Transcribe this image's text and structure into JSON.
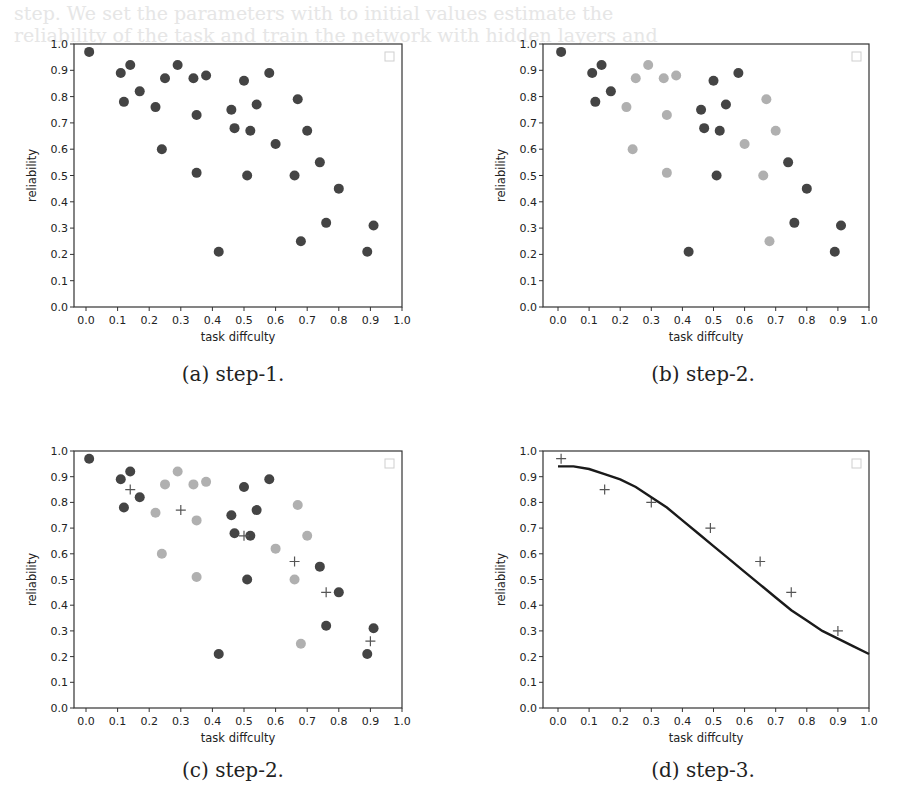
{
  "background_text": [
    "step. We set the parameters with to initial values estimate the",
    "reliability of the task and train the network with hidden layers and",
    "the output is the reliability function mapped by the logistic model"
  ],
  "chart_data": [
    {
      "id": "a",
      "type": "scatter",
      "caption": "(a) step-1.",
      "xlabel": "task diffculty",
      "ylabel": "reliability",
      "xlim": [
        0.0,
        1.0
      ],
      "ylim": [
        0.0,
        1.0
      ],
      "xticks": [
        "0.0",
        "0.1",
        "0.2",
        "0.3",
        "0.4",
        "0.5",
        "0.6",
        "0.7",
        "0.8",
        "0.9",
        "1.0"
      ],
      "yticks": [
        "0.0",
        "0.1",
        "0.2",
        "0.3",
        "0.4",
        "0.5",
        "0.6",
        "0.7",
        "0.8",
        "0.9",
        "1.0"
      ],
      "grid": false,
      "legend": "empty box, upper right",
      "series": [
        {
          "name": "tasks",
          "marker": "circle",
          "color": "#444444",
          "points": [
            [
              0.01,
              0.97
            ],
            [
              0.11,
              0.89
            ],
            [
              0.14,
              0.92
            ],
            [
              0.12,
              0.78
            ],
            [
              0.17,
              0.82
            ],
            [
              0.22,
              0.76
            ],
            [
              0.25,
              0.87
            ],
            [
              0.29,
              0.92
            ],
            [
              0.24,
              0.6
            ],
            [
              0.34,
              0.87
            ],
            [
              0.38,
              0.88
            ],
            [
              0.35,
              0.73
            ],
            [
              0.35,
              0.51
            ],
            [
              0.42,
              0.21
            ],
            [
              0.5,
              0.86
            ],
            [
              0.58,
              0.89
            ],
            [
              0.46,
              0.75
            ],
            [
              0.54,
              0.77
            ],
            [
              0.47,
              0.68
            ],
            [
              0.52,
              0.67
            ],
            [
              0.51,
              0.5
            ],
            [
              0.6,
              0.62
            ],
            [
              0.67,
              0.79
            ],
            [
              0.7,
              0.67
            ],
            [
              0.66,
              0.5
            ],
            [
              0.74,
              0.55
            ],
            [
              0.8,
              0.45
            ],
            [
              0.76,
              0.32
            ],
            [
              0.68,
              0.25
            ],
            [
              0.89,
              0.21
            ],
            [
              0.91,
              0.31
            ]
          ]
        }
      ]
    },
    {
      "id": "b",
      "type": "scatter",
      "caption": "(b) step-2.",
      "xlabel": "task diffculty",
      "ylabel": "reliability",
      "xlim": [
        0.0,
        1.0
      ],
      "ylim": [
        0.0,
        1.0
      ],
      "xticks": [
        "0.0",
        "0.1",
        "0.2",
        "0.3",
        "0.4",
        "0.5",
        "0.6",
        "0.7",
        "0.8",
        "0.9",
        "1.0"
      ],
      "yticks": [
        "0.0",
        "0.1",
        "0.2",
        "0.3",
        "0.4",
        "0.5",
        "0.6",
        "0.7",
        "0.8",
        "0.9",
        "1.0"
      ],
      "grid": false,
      "legend": "empty box, upper right",
      "series": [
        {
          "name": "cluster-dark",
          "marker": "circle",
          "color": "#444444",
          "points": [
            [
              0.01,
              0.97
            ],
            [
              0.11,
              0.89
            ],
            [
              0.14,
              0.92
            ],
            [
              0.12,
              0.78
            ],
            [
              0.17,
              0.82
            ],
            [
              0.42,
              0.21
            ],
            [
              0.5,
              0.86
            ],
            [
              0.58,
              0.89
            ],
            [
              0.46,
              0.75
            ],
            [
              0.54,
              0.77
            ],
            [
              0.47,
              0.68
            ],
            [
              0.52,
              0.67
            ],
            [
              0.51,
              0.5
            ],
            [
              0.74,
              0.55
            ],
            [
              0.8,
              0.45
            ],
            [
              0.76,
              0.32
            ],
            [
              0.89,
              0.21
            ],
            [
              0.91,
              0.31
            ]
          ]
        },
        {
          "name": "cluster-light",
          "marker": "circle",
          "color": "#b0b0b0",
          "points": [
            [
              0.22,
              0.76
            ],
            [
              0.25,
              0.87
            ],
            [
              0.29,
              0.92
            ],
            [
              0.24,
              0.6
            ],
            [
              0.34,
              0.87
            ],
            [
              0.38,
              0.88
            ],
            [
              0.35,
              0.73
            ],
            [
              0.35,
              0.51
            ],
            [
              0.6,
              0.62
            ],
            [
              0.67,
              0.79
            ],
            [
              0.7,
              0.67
            ],
            [
              0.66,
              0.5
            ],
            [
              0.68,
              0.25
            ]
          ]
        }
      ]
    },
    {
      "id": "c",
      "type": "scatter",
      "caption": "(c) step-2.",
      "xlabel": "task diffculty",
      "ylabel": "reliability",
      "xlim": [
        0.0,
        1.0
      ],
      "ylim": [
        0.0,
        1.0
      ],
      "xticks": [
        "0.0",
        "0.1",
        "0.2",
        "0.3",
        "0.4",
        "0.5",
        "0.6",
        "0.7",
        "0.8",
        "0.9",
        "1.0"
      ],
      "yticks": [
        "0.0",
        "0.1",
        "0.2",
        "0.3",
        "0.4",
        "0.5",
        "0.6",
        "0.7",
        "0.8",
        "0.9",
        "1.0"
      ],
      "grid": false,
      "legend": "empty box, upper right",
      "series": [
        {
          "name": "cluster-dark",
          "marker": "circle",
          "color": "#444444",
          "points": [
            [
              0.01,
              0.97
            ],
            [
              0.11,
              0.89
            ],
            [
              0.14,
              0.92
            ],
            [
              0.12,
              0.78
            ],
            [
              0.17,
              0.82
            ],
            [
              0.42,
              0.21
            ],
            [
              0.5,
              0.86
            ],
            [
              0.58,
              0.89
            ],
            [
              0.46,
              0.75
            ],
            [
              0.54,
              0.77
            ],
            [
              0.47,
              0.68
            ],
            [
              0.52,
              0.67
            ],
            [
              0.51,
              0.5
            ],
            [
              0.74,
              0.55
            ],
            [
              0.8,
              0.45
            ],
            [
              0.76,
              0.32
            ],
            [
              0.89,
              0.21
            ],
            [
              0.91,
              0.31
            ]
          ]
        },
        {
          "name": "cluster-light",
          "marker": "circle",
          "color": "#b0b0b0",
          "points": [
            [
              0.22,
              0.76
            ],
            [
              0.25,
              0.87
            ],
            [
              0.29,
              0.92
            ],
            [
              0.24,
              0.6
            ],
            [
              0.34,
              0.87
            ],
            [
              0.38,
              0.88
            ],
            [
              0.35,
              0.73
            ],
            [
              0.35,
              0.51
            ],
            [
              0.6,
              0.62
            ],
            [
              0.67,
              0.79
            ],
            [
              0.7,
              0.67
            ],
            [
              0.66,
              0.5
            ],
            [
              0.68,
              0.25
            ]
          ]
        },
        {
          "name": "centroids",
          "marker": "plus",
          "color": "#555555",
          "points": [
            [
              0.14,
              0.85
            ],
            [
              0.3,
              0.77
            ],
            [
              0.5,
              0.67
            ],
            [
              0.66,
              0.57
            ],
            [
              0.76,
              0.45
            ],
            [
              0.9,
              0.26
            ]
          ]
        }
      ]
    },
    {
      "id": "d",
      "type": "line",
      "caption": "(d) step-3.",
      "xlabel": "task diffculty",
      "ylabel": "reliability",
      "xlim": [
        0.0,
        1.0
      ],
      "ylim": [
        0.0,
        1.0
      ],
      "xticks": [
        "0.0",
        "0.1",
        "0.2",
        "0.3",
        "0.4",
        "0.5",
        "0.6",
        "0.7",
        "0.8",
        "0.9",
        "1.0"
      ],
      "yticks": [
        "0.0",
        "0.1",
        "0.2",
        "0.3",
        "0.4",
        "0.5",
        "0.6",
        "0.7",
        "0.8",
        "0.9",
        "1.0"
      ],
      "grid": false,
      "legend": "empty box, upper right",
      "series": [
        {
          "name": "centroids",
          "marker": "plus",
          "color": "#555555",
          "points": [
            [
              0.01,
              0.97
            ],
            [
              0.15,
              0.85
            ],
            [
              0.3,
              0.8
            ],
            [
              0.49,
              0.7
            ],
            [
              0.65,
              0.57
            ],
            [
              0.75,
              0.45
            ],
            [
              0.9,
              0.3
            ]
          ]
        },
        {
          "name": "fitted-curve",
          "marker": "none",
          "color": "#1a1a1a",
          "points": [
            [
              0.0,
              0.94
            ],
            [
              0.05,
              0.94
            ],
            [
              0.1,
              0.93
            ],
            [
              0.15,
              0.91
            ],
            [
              0.2,
              0.89
            ],
            [
              0.25,
              0.86
            ],
            [
              0.3,
              0.82
            ],
            [
              0.35,
              0.78
            ],
            [
              0.4,
              0.73
            ],
            [
              0.45,
              0.68
            ],
            [
              0.5,
              0.63
            ],
            [
              0.55,
              0.58
            ],
            [
              0.6,
              0.53
            ],
            [
              0.65,
              0.48
            ],
            [
              0.7,
              0.43
            ],
            [
              0.75,
              0.38
            ],
            [
              0.8,
              0.34
            ],
            [
              0.85,
              0.3
            ],
            [
              0.9,
              0.27
            ],
            [
              0.95,
              0.24
            ],
            [
              1.0,
              0.21
            ]
          ]
        }
      ]
    }
  ]
}
